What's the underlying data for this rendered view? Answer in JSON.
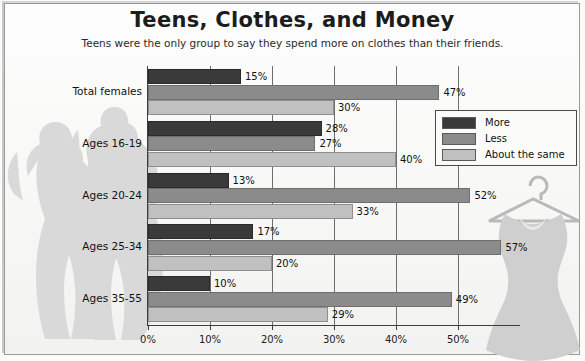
{
  "title": "Teens, Clothes, and Money",
  "subtitle": "Teens were the only group to say they spend more on clothes than their friends.",
  "legend": {
    "items": [
      {
        "label": "More",
        "color": "#3a3a3a"
      },
      {
        "label": "Less",
        "color": "#8b8b8b"
      },
      {
        "label": "About the same",
        "color": "#c0c0c0"
      }
    ]
  },
  "axis": {
    "ticks": [
      "0%",
      "10%",
      "20%",
      "30%",
      "40%",
      "50%"
    ]
  },
  "decor": {
    "left_silhouette": "two-girls-silhouette",
    "right_silhouette": "dress-on-hanger-silhouette"
  },
  "chart_data": {
    "type": "bar",
    "orientation": "horizontal",
    "title": "Teens, Clothes, and Money",
    "subtitle": "Teens were the only group to say they spend more on clothes than their friends.",
    "xlabel": "",
    "ylabel": "",
    "xlim": [
      0,
      60
    ],
    "xticks": [
      0,
      10,
      20,
      30,
      40,
      50
    ],
    "xtick_labels": [
      "0%",
      "10%",
      "20%",
      "30%",
      "40%",
      "50%"
    ],
    "grid": true,
    "legend_position": "right",
    "categories": [
      "Total females",
      "Ages 16-19",
      "Ages 20-24",
      "Ages 25-34",
      "Ages 35-55"
    ],
    "series": [
      {
        "name": "More",
        "color": "#3a3a3a",
        "values": [
          15,
          28,
          13,
          17,
          10
        ],
        "labels": [
          "15%",
          "28%",
          "13%",
          "17%",
          "10%"
        ]
      },
      {
        "name": "Less",
        "color": "#8b8b8b",
        "values": [
          47,
          27,
          52,
          57,
          49
        ],
        "labels": [
          "47%",
          "27%",
          "52%",
          "57%",
          "49%"
        ]
      },
      {
        "name": "About the same",
        "color": "#c0c0c0",
        "values": [
          30,
          40,
          33,
          20,
          29
        ],
        "labels": [
          "30%",
          "40%",
          "33%",
          "20%",
          "29%"
        ]
      }
    ]
  }
}
